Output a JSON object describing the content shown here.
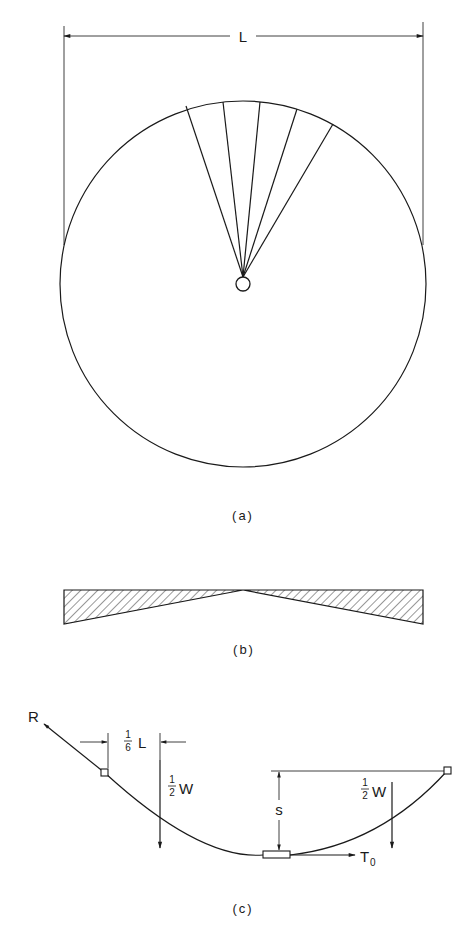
{
  "figure": {
    "panels": [
      {
        "id": "a",
        "caption": "(a)",
        "description": "Circular membrane of diameter L with five radial spokes from central hub",
        "dimension_label": "L",
        "spoke_count": 5
      },
      {
        "id": "b",
        "caption": "(b)",
        "description": "Hatched cross-section tapering to zero thickness at center"
      },
      {
        "id": "c",
        "caption": "(c)",
        "description": "Catenary cable with end reactions, half loads and sag",
        "labels": {
          "reaction": "R",
          "offset_numerator": "1",
          "offset_denominator": "6",
          "offset_symbol": "L",
          "load_left_numerator": "1",
          "load_left_denominator": "2",
          "load_left_symbol": "W",
          "load_right_numerator": "1",
          "load_right_denominator": "2",
          "load_right_symbol": "W",
          "sag": "s",
          "tension_symbol": "T",
          "tension_subscript": "0"
        }
      }
    ]
  },
  "colors": {
    "ink": "#1a1a1a",
    "background": "#ffffff"
  }
}
